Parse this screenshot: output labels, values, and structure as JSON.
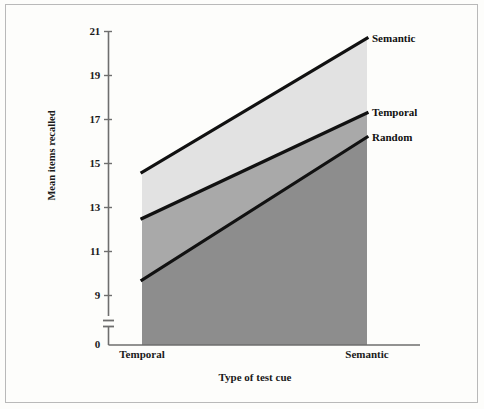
{
  "chart_data": {
    "type": "line",
    "title": "",
    "xlabel": "Type of test cue",
    "ylabel": "Mean items recalled",
    "categories": [
      "Temporal",
      "Semantic"
    ],
    "x": [
      0,
      1
    ],
    "series": [
      {
        "name": "Semantic",
        "values": [
          14.6,
          20.7
        ],
        "label_position": "right-top",
        "fill": "#e2e2e2"
      },
      {
        "name": "Temporal",
        "values": [
          12.5,
          17.3
        ],
        "label_position": "right-middle",
        "fill": "#a9a9a9"
      },
      {
        "name": "Random",
        "values": [
          9.7,
          16.2
        ],
        "label_position": "right-lower",
        "fill": "#8d8d8d"
      }
    ],
    "yticks": [
      9,
      11,
      13,
      15,
      17,
      19,
      21
    ],
    "ytick_labels": [
      "9",
      "11",
      "13",
      "15",
      "17",
      "19",
      "21"
    ],
    "origin_label": "0",
    "ylim": [
      9,
      21
    ],
    "axis_break": true,
    "grid": false,
    "legend_position": "inline-right",
    "line_color": "#111111",
    "axis_color": "#6e6e6e",
    "frame_color": "#b9b9b9",
    "background": "#fdfdfb"
  },
  "axis": {
    "y_title": "Mean items recalled",
    "x_title": "Type of test cue",
    "y_ticks": [
      "21",
      "19",
      "17",
      "15",
      "13",
      "11",
      "9"
    ],
    "zero": "0",
    "x_ticks": [
      "Temporal",
      "Semantic"
    ]
  },
  "legend": {
    "items": [
      {
        "label": "Semantic"
      },
      {
        "label": "Temporal"
      },
      {
        "label": "Random"
      }
    ]
  }
}
